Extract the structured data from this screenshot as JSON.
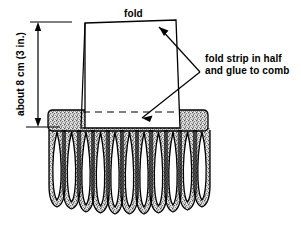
{
  "figure": {
    "labels": {
      "fold": "fold",
      "instruction_line1": "fold strip in half",
      "instruction_line2": "and glue to comb",
      "dimension": "about 8 cm (3 in.)"
    },
    "colors": {
      "line": "#000000",
      "background": "#ffffff",
      "stipple_light": "#d2d2d2",
      "stipple_dark": "#606060",
      "paper_fill": "#ffffff"
    },
    "comb": {
      "teeth_count": 11,
      "spine_label": "comb-spine",
      "tooth_label": "comb-tooth"
    },
    "annotations": {
      "arrow_upper": "arrow-to-fold-edge",
      "arrow_lower": "arrow-to-glue-line",
      "dashed_line": "hidden-fold-edge",
      "dimension_line": "height-dimension-line"
    }
  }
}
